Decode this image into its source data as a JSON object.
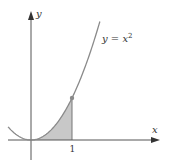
{
  "figure": {
    "type": "function-graph",
    "function_label": "y = x",
    "function_exponent": "2",
    "x_axis_label": "x",
    "y_axis_label": "y",
    "tick_labels": [
      "1"
    ],
    "shaded_region": {
      "from": 0,
      "to": 1,
      "description": "area under y = x^2 from 0 to 1"
    },
    "marked_point": {
      "x": 1,
      "y": 1
    },
    "colors": {
      "curve": "#8a8a8a",
      "shade": "#c8c8c8",
      "axes": "#555555",
      "point": "#8a8a8a"
    }
  }
}
